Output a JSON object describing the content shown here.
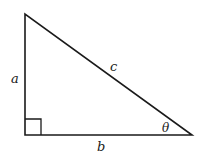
{
  "diagram": {
    "type": "right-triangle",
    "labels": {
      "vertical_side": "a",
      "horizontal_side": "b",
      "hypotenuse": "c",
      "angle": "θ"
    },
    "vertices": {
      "top": [
        25,
        14
      ],
      "right_angle": [
        25,
        135
      ],
      "acute": [
        192,
        135
      ]
    },
    "right_angle_marker_size": 16,
    "stroke_color": "#1a1a1a"
  }
}
